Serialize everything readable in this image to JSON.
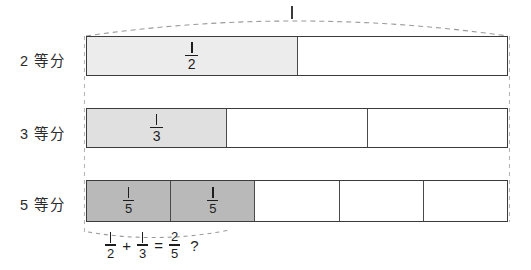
{
  "figure": {
    "title_label": "1",
    "background_color": "#ffffff",
    "line_color": "#3b3b3b",
    "dash_color": "#9a9a9a"
  },
  "rows": [
    {
      "label": "2 等分",
      "divisions": 2,
      "shaded": 1,
      "shade_color": "#ececec",
      "fraction": {
        "numerator": "1",
        "denominator": "2"
      },
      "cell_labels": [
        "1/2",
        "",
        "",
        "",
        ""
      ]
    },
    {
      "label": "3 等分",
      "divisions": 3,
      "shaded": 1,
      "shade_color": "#e0e0e0",
      "fraction": {
        "numerator": "1",
        "denominator": "3"
      },
      "cell_labels": [
        "1/3",
        "",
        "",
        "",
        ""
      ]
    },
    {
      "label": "5 等分",
      "divisions": 5,
      "shaded": 2,
      "shade_color": "#b9b9b9",
      "fraction": {
        "numerator": "1",
        "denominator": "5"
      },
      "cell_labels": [
        "1/5",
        "1/5",
        "",
        "",
        ""
      ]
    }
  ],
  "equation": {
    "term1": {
      "numerator": "1",
      "denominator": "2"
    },
    "plus": "+",
    "term2": {
      "numerator": "1",
      "denominator": "3"
    },
    "equals": "=",
    "result": {
      "numerator": "2",
      "denominator": "5"
    },
    "question": "?"
  }
}
